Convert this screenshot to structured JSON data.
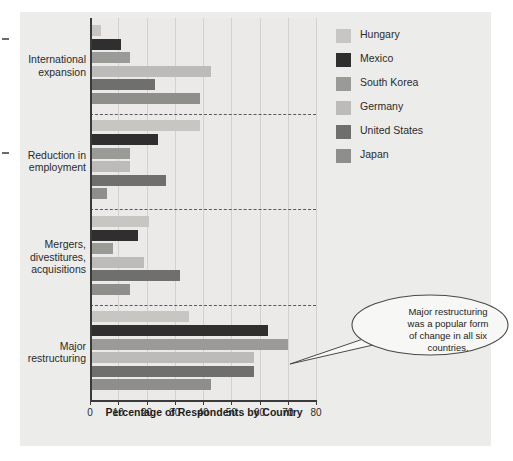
{
  "chart_data": {
    "type": "bar",
    "orientation": "horizontal",
    "title": "",
    "xlabel": "Percentage of Respondents by Country",
    "ylabel": "",
    "xlim": [
      0,
      80
    ],
    "xticks": [
      0,
      10,
      20,
      30,
      40,
      50,
      60,
      70,
      80
    ],
    "grid": true,
    "legend_position": "right",
    "categories": [
      "International expansion",
      "Reduction in employment",
      "Mergers, divestitures, acquisitions",
      "Major restructuring"
    ],
    "series": [
      {
        "name": "Hungary",
        "color": "#c8c6c2",
        "values": [
          4,
          39,
          21,
          35
        ]
      },
      {
        "name": "Mexico",
        "color": "#2f2f2f",
        "values": [
          11,
          24,
          17,
          63
        ]
      },
      {
        "name": "South Korea",
        "color": "#9a9a96",
        "values": [
          14,
          14,
          8,
          70
        ]
      },
      {
        "name": "Germany",
        "color": "#bdbbb7",
        "values": [
          43,
          14,
          19,
          58
        ]
      },
      {
        "name": "United States",
        "color": "#6f6f6d",
        "values": [
          23,
          27,
          32,
          58
        ]
      },
      {
        "name": "Japan",
        "color": "#8e8e8a",
        "values": [
          39,
          6,
          14,
          43
        ]
      }
    ],
    "annotations": [
      {
        "text": "Major restructuring was a popular form of change in all six countries.",
        "lines": [
          "Major restructuring",
          "was a popular form",
          "of change in all six",
          "countries."
        ],
        "points_to_series": "South Korea",
        "points_to_category": "Major restructuring",
        "points_to_value": 70
      }
    ]
  },
  "legend": {
    "items": [
      {
        "label": "Hungary",
        "color": "#c8c6c2"
      },
      {
        "label": "Mexico",
        "color": "#2f2f2f"
      },
      {
        "label": "South Korea",
        "color": "#9a9a96"
      },
      {
        "label": "Germany",
        "color": "#bdbbb7"
      },
      {
        "label": "United States",
        "color": "#6f6f6d"
      },
      {
        "label": "Japan",
        "color": "#8e8e8a"
      }
    ]
  },
  "axis": {
    "x_title": "Percentage of Respondents by Country",
    "tick_labels": [
      "0",
      "10",
      "20",
      "30",
      "40",
      "50",
      "60",
      "70",
      "80"
    ]
  },
  "category_labels": [
    {
      "lines": [
        "International",
        "expansion"
      ]
    },
    {
      "lines": [
        "Reduction in",
        "employment"
      ]
    },
    {
      "lines": [
        "Mergers,",
        "divestitures,",
        "acquisitions"
      ]
    },
    {
      "lines": [
        "Major",
        "restructuring"
      ]
    }
  ],
  "callout": {
    "line1": "Major restructuring",
    "line2": "was a popular form",
    "line3": "of change in all six",
    "line4": "countries."
  }
}
